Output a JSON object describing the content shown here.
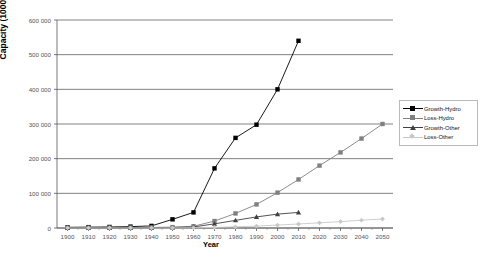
{
  "chart_data": {
    "type": "line",
    "title": "",
    "xlabel": "Year",
    "ylabel": "Capacity (1000m³)",
    "xlim": [
      1895,
      2055
    ],
    "ylim": [
      0,
      600000
    ],
    "grid": "horizontal",
    "legend_position": "right",
    "ytick_labels": [
      "600 000",
      "500 000",
      "400 000",
      "300 000",
      "200 000",
      "100 000",
      "0"
    ],
    "ytick_values": [
      600000,
      500000,
      400000,
      300000,
      200000,
      100000,
      0
    ],
    "xtick_labels": [
      "1900",
      "1910",
      "1920",
      "1930",
      "1940",
      "1950",
      "1960",
      "1970",
      "1980",
      "1990",
      "2000",
      "2010",
      "2020",
      "2030",
      "2040",
      "2050"
    ],
    "xtick_values": [
      1900,
      1910,
      1920,
      1930,
      1940,
      1950,
      1960,
      1970,
      1980,
      1990,
      2000,
      2010,
      2020,
      2030,
      2040,
      2050
    ],
    "series": [
      {
        "name": "Growth-Hydro",
        "marker": "square",
        "color": "#000000",
        "x": [
          1900,
          1910,
          1920,
          1930,
          1940,
          1950,
          1960,
          1970,
          1980,
          1990,
          2000,
          2010
        ],
        "values": [
          2000,
          2500,
          3000,
          4000,
          6000,
          25000,
          45000,
          172000,
          260000,
          298000,
          400000,
          540000
        ]
      },
      {
        "name": "Loss-Hydro",
        "marker": "square",
        "color": "#808080",
        "x": [
          1900,
          1910,
          1920,
          1930,
          1940,
          1950,
          1960,
          1970,
          1980,
          1990,
          2000,
          2010,
          2020,
          2030,
          2040,
          2050
        ],
        "values": [
          500,
          700,
          900,
          1200,
          1600,
          2500,
          5000,
          20000,
          42000,
          68000,
          102000,
          140000,
          180000,
          218000,
          258000,
          300000
        ]
      },
      {
        "name": "Growth-Other",
        "marker": "triangle",
        "color": "#404040",
        "x": [
          1900,
          1910,
          1920,
          1930,
          1940,
          1950,
          1960,
          1970,
          1980,
          1990,
          2000,
          2010
        ],
        "values": [
          300,
          400,
          500,
          700,
          900,
          1500,
          3000,
          12000,
          22000,
          32000,
          40000,
          45000
        ]
      },
      {
        "name": "Loss-Other",
        "marker": "diamond",
        "color": "#c8c8c8",
        "x": [
          1900,
          1910,
          1920,
          1930,
          1940,
          1950,
          1960,
          1970,
          1980,
          1990,
          2000,
          2010,
          2020,
          2030,
          2040,
          2050
        ],
        "values": [
          100,
          120,
          150,
          200,
          260,
          400,
          700,
          1800,
          3500,
          5500,
          8500,
          11500,
          15000,
          18500,
          22500,
          26000
        ]
      }
    ]
  }
}
